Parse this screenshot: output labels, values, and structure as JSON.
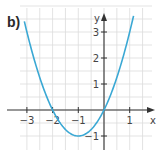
{
  "panel_label": "b)",
  "chart_data": {
    "type": "line",
    "title": "",
    "function": "y = x^2 + 2x",
    "xlabel": "x",
    "ylabel": "y",
    "xlim": [
      -3.8,
      1.8
    ],
    "ylim": [
      -1.3,
      4.1
    ],
    "x_ticks": [
      -3,
      -2,
      -1,
      1
    ],
    "y_ticks": [
      -1,
      1,
      2,
      3
    ],
    "x_tick_labels": [
      "−3",
      "−2",
      "−1",
      "1"
    ],
    "y_tick_labels": [
      "−1",
      "1",
      "2",
      "3"
    ],
    "grid": true,
    "grid_step": 0.5,
    "legend": null,
    "series": [
      {
        "name": "parabola",
        "color": "#3aa8d4",
        "x": [
          -3.1,
          -3,
          -2.5,
          -2,
          -1.5,
          -1,
          -0.5,
          0,
          0.5,
          1,
          1.15
        ],
        "y": [
          3.41,
          3,
          1.25,
          0,
          -0.75,
          -1,
          -0.75,
          0,
          1.25,
          3,
          3.62
        ]
      }
    ],
    "key_points": {
      "roots": [
        -2,
        0
      ],
      "vertex": [
        -1,
        -1
      ]
    }
  },
  "colors": {
    "curve": "#3aa8d4",
    "axis": "#333333",
    "grid": "#dcdcdc"
  }
}
